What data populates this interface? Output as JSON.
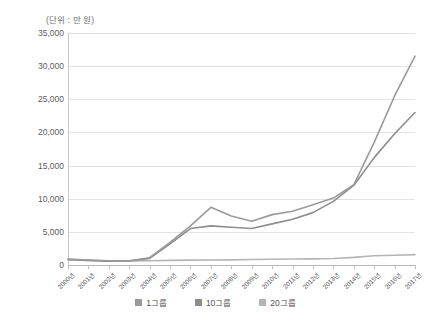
{
  "chart_data": {
    "type": "line",
    "title": "",
    "unit_note": "(단위 : 만 원)",
    "xlabel": "",
    "ylabel": "",
    "ylim": [
      0,
      35000
    ],
    "ytick_step": 5000,
    "ytick_labels": [
      "35,000",
      "30,000",
      "25,000",
      "20,000",
      "15,000",
      "10,000",
      "5,000",
      "0"
    ],
    "ytick_values": [
      35000,
      30000,
      25000,
      20000,
      15000,
      10000,
      5000,
      0
    ],
    "grid": true,
    "legend_position": "bottom",
    "categories": [
      "2000년",
      "2001년",
      "2002년",
      "2003년",
      "2004년",
      "2005년",
      "2006년",
      "2007년",
      "2008년",
      "2009년",
      "2010년",
      "2011년",
      "2012년",
      "2013년",
      "2014년",
      "2015년",
      "2016년",
      "2017년"
    ],
    "series": [
      {
        "name": "1그룹",
        "color": "#9a9a9a",
        "values": [
          900,
          750,
          620,
          650,
          1100,
          3400,
          5900,
          8700,
          7400,
          6600,
          7600,
          8100,
          9100,
          10100,
          12100,
          18500,
          25500,
          31500
        ]
      },
      {
        "name": "10그룹",
        "color": "#8d8d8d",
        "values": [
          800,
          680,
          560,
          600,
          1000,
          3200,
          5500,
          5900,
          5700,
          5500,
          6200,
          6900,
          7900,
          9600,
          12000,
          16200,
          19800,
          23000
        ]
      },
      {
        "name": "20그룹",
        "color": "#b5b5b5",
        "values": [
          820,
          700,
          600,
          620,
          640,
          700,
          740,
          760,
          780,
          820,
          870,
          900,
          930,
          980,
          1150,
          1400,
          1480,
          1560
        ]
      }
    ]
  },
  "legend": {
    "items": [
      {
        "label": "1그룹",
        "color": "#9a9a9a"
      },
      {
        "label": "10그룹",
        "color": "#8d8d8d"
      },
      {
        "label": "20그룹",
        "color": "#b5b5b5"
      }
    ]
  }
}
